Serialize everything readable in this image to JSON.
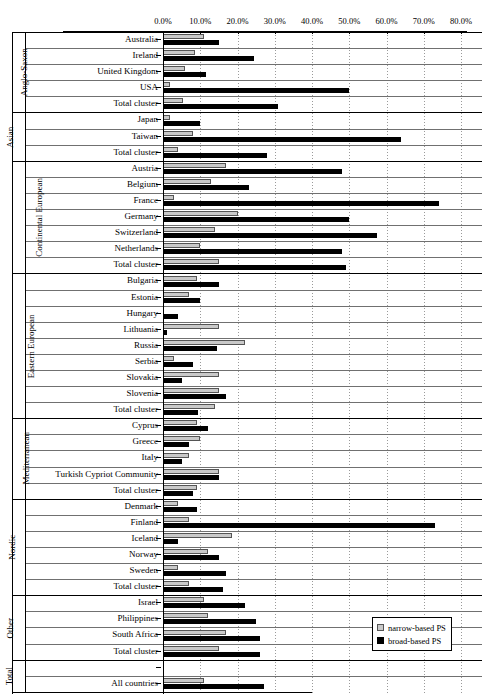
{
  "chart_data": {
    "type": "bar",
    "orientation": "horizontal",
    "title": "",
    "xlabel": "",
    "ylabel": "",
    "xlim": [
      0,
      80
    ],
    "xticks": [
      "0.0%",
      "10.0%",
      "20.0%",
      "30.0%",
      "40.0%",
      "50.0%",
      "60.0%",
      "70.0%",
      "80.0%"
    ],
    "xtick_values": [
      0,
      10,
      20,
      30,
      40,
      50,
      60,
      70,
      80
    ],
    "grid": "vertical-dotted",
    "legend_position": "bottom-right",
    "series": [
      {
        "name": "narrow-based PS",
        "color": "#c9c9c9"
      },
      {
        "name": "broad-based PS",
        "color": "#000000"
      }
    ],
    "clusters": [
      {
        "name": "Anglo-Saxon",
        "rows": [
          {
            "label": "Australia",
            "narrow": 11.0,
            "broad": 15.0
          },
          {
            "label": "Ireland",
            "narrow": 8.5,
            "broad": 24.5
          },
          {
            "label": "United Kingdom",
            "narrow": 6.0,
            "broad": 11.5
          },
          {
            "label": "USA",
            "narrow": 1.8,
            "broad": 50.0
          },
          {
            "label": "Total cluster",
            "narrow": 5.5,
            "broad": 31.0
          }
        ]
      },
      {
        "name": "Asian",
        "rows": [
          {
            "label": "Japan",
            "narrow": 2.0,
            "broad": 10.0
          },
          {
            "label": "Taiwan",
            "narrow": 8.0,
            "broad": 64.0
          },
          {
            "label": "Total cluster",
            "narrow": 4.0,
            "broad": 28.0
          }
        ]
      },
      {
        "name": "Continental European",
        "rows": [
          {
            "label": "Austria",
            "narrow": 17.0,
            "broad": 48.0
          },
          {
            "label": "Belgium",
            "narrow": 13.0,
            "broad": 23.0
          },
          {
            "label": "France",
            "narrow": 3.0,
            "broad": 74.0
          },
          {
            "label": "Germany",
            "narrow": 20.0,
            "broad": 50.0
          },
          {
            "label": "Switzerland",
            "narrow": 14.0,
            "broad": 57.5
          },
          {
            "label": "Netherlands",
            "narrow": 10.0,
            "broad": 48.0
          },
          {
            "label": "Total cluster",
            "narrow": 15.0,
            "broad": 49.0
          }
        ]
      },
      {
        "name": "Eastern European",
        "rows": [
          {
            "label": "Bulgaria",
            "narrow": 9.0,
            "broad": 15.0
          },
          {
            "label": "Estonia",
            "narrow": 7.0,
            "broad": 10.0
          },
          {
            "label": "Hungary",
            "narrow": 0.0,
            "broad": 4.0
          },
          {
            "label": "Lithuania",
            "narrow": 15.0,
            "broad": 1.0
          },
          {
            "label": "Russia",
            "narrow": 22.0,
            "broad": 14.5
          },
          {
            "label": "Serbia",
            "narrow": 3.0,
            "broad": 8.0
          },
          {
            "label": "Slovakia",
            "narrow": 15.0,
            "broad": 5.0
          },
          {
            "label": "Slovenia",
            "narrow": 15.0,
            "broad": 17.0
          },
          {
            "label": "Total cluster",
            "narrow": 14.0,
            "broad": 9.5
          }
        ]
      },
      {
        "name": "Mediterranean",
        "rows": [
          {
            "label": "Cyprus",
            "narrow": 9.0,
            "broad": 12.0
          },
          {
            "label": "Greece",
            "narrow": 10.0,
            "broad": 7.0
          },
          {
            "label": "Italy",
            "narrow": 7.0,
            "broad": 5.0
          },
          {
            "label": "Turkish Cypriot Community",
            "narrow": 15.0,
            "broad": 15.0
          },
          {
            "label": "Total cluster",
            "narrow": 9.0,
            "broad": 8.0
          }
        ]
      },
      {
        "name": "Nordic",
        "rows": [
          {
            "label": "Denmark",
            "narrow": 4.0,
            "broad": 9.0
          },
          {
            "label": "Finland",
            "narrow": 7.0,
            "broad": 73.0
          },
          {
            "label": "Iceland",
            "narrow": 18.5,
            "broad": 4.0
          },
          {
            "label": "Norway",
            "narrow": 12.0,
            "broad": 15.0
          },
          {
            "label": "Sweden",
            "narrow": 4.0,
            "broad": 17.0
          },
          {
            "label": "Total cluster",
            "narrow": 7.0,
            "broad": 16.0
          }
        ]
      },
      {
        "name": "Other",
        "rows": [
          {
            "label": "Israel",
            "narrow": 11.0,
            "broad": 22.0
          },
          {
            "label": "Philippines",
            "narrow": 12.0,
            "broad": 25.0
          },
          {
            "label": "South Africa",
            "narrow": 17.0,
            "broad": 26.0
          },
          {
            "label": "Total cluster",
            "narrow": 15.0,
            "broad": 26.0
          }
        ]
      },
      {
        "name": "Total",
        "rows": [
          {
            "label": "",
            "narrow": null,
            "broad": null
          },
          {
            "label": "All countries",
            "narrow": 11.0,
            "broad": 27.0
          }
        ]
      }
    ]
  },
  "legend": {
    "items": [
      {
        "label": "narrow-based PS",
        "swatch": "narrow"
      },
      {
        "label": "broad-based PS",
        "swatch": "broad"
      }
    ]
  }
}
